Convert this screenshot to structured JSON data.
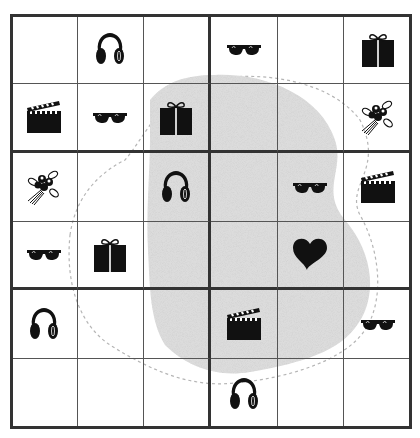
{
  "puzzle": {
    "rows": 6,
    "cols": 6,
    "box_rows": 2,
    "box_cols": 3,
    "colors": {
      "grid_line": "#555555",
      "box_line": "#333333",
      "icon": "#111111",
      "region_fill": "#d9d9d9",
      "region_outline": "#b0b0b0"
    },
    "cells": [
      [
        "",
        "headphones",
        "",
        "sunglasses",
        "",
        "gift"
      ],
      [
        "clapperboard",
        "sunglasses",
        "gift",
        "",
        "",
        "bouquet"
      ],
      [
        "bouquet",
        "",
        "headphones",
        "",
        "sunglasses",
        "clapperboard"
      ],
      [
        "sunglasses",
        "gift",
        "",
        "",
        "heart",
        ""
      ],
      [
        "headphones",
        "",
        "",
        "clapperboard",
        "",
        "sunglasses"
      ],
      [
        "",
        "",
        "",
        "headphones",
        "",
        ""
      ]
    ],
    "highlighted_region": "grey-blob"
  }
}
